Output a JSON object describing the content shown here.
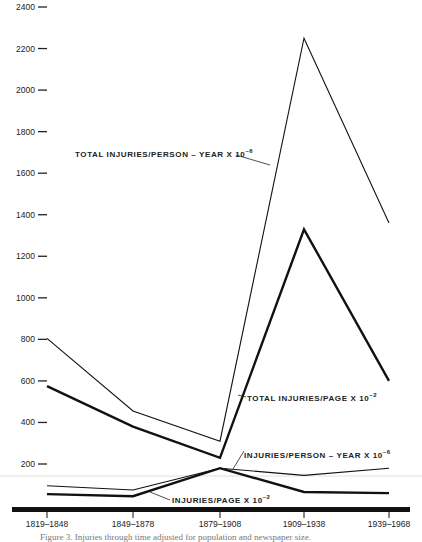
{
  "chart_data": {
    "type": "line",
    "title": "",
    "xlabel": "",
    "ylabel": "",
    "ylim": [
      0,
      2400
    ],
    "yticks": [
      200,
      400,
      600,
      800,
      1000,
      1200,
      1400,
      1600,
      1800,
      2000,
      2200,
      2400
    ],
    "categories": [
      "1819–1848",
      "1849–1878",
      "1879–1908",
      "1909–1938",
      "1939–1968"
    ],
    "grid": false,
    "legend": "inline labels",
    "series": [
      {
        "name": "TOTAL INJURIES/PERSON – YEAR X 10⁻⁶",
        "style": "thin",
        "values": [
          805,
          455,
          310,
          2250,
          1360
        ]
      },
      {
        "name": "TOTAL INJURIES/PAGE X 10⁻²",
        "style": "thick",
        "values": [
          575,
          380,
          230,
          1330,
          600
        ]
      },
      {
        "name": "INJURIES/PERSON – YEAR X 10⁻⁶",
        "style": "thin",
        "values": [
          95,
          75,
          180,
          145,
          180
        ]
      },
      {
        "name": "INJURIES/PAGE X 10⁻²",
        "style": "thick",
        "values": [
          55,
          45,
          180,
          65,
          60
        ]
      }
    ]
  },
  "labels": {
    "total_person_year": {
      "text": "TOTAL INJURIES/PERSON – YEAR X 10",
      "exp": "–6"
    },
    "total_page": {
      "text": "TOTAL INJURIES/PAGE X 10",
      "exp": "–2"
    },
    "person_year": {
      "text": "INJURIES/PERSON – YEAR X 10",
      "exp": "–6"
    },
    "page": {
      "text": "INJURIES/PAGE X 10",
      "exp": "–2"
    }
  },
  "caption": "Figure 3.  Injuries through time adjusted for population and newspaper size."
}
